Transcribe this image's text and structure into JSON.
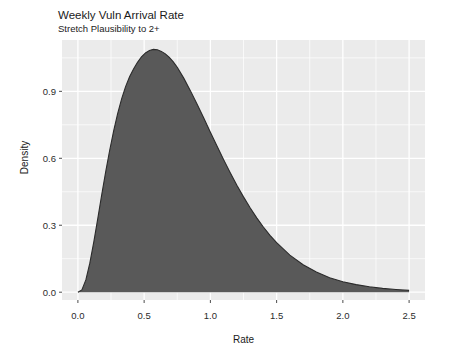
{
  "chart_data": {
    "type": "area",
    "title": "Weekly Vuln Arrival Rate",
    "subtitle": "Stretch Plausibility to 2+",
    "xlabel": "Rate",
    "ylabel": "Density",
    "xlim": [
      -0.12,
      2.62
    ],
    "ylim": [
      -0.035,
      1.13
    ],
    "xticks": [
      0.0,
      0.5,
      1.0,
      1.5,
      2.0,
      2.5
    ],
    "xtick_labels": [
      "0.0",
      "0.5",
      "1.0",
      "1.5",
      "2.0",
      "2.5"
    ],
    "yticks": [
      0.0,
      0.3,
      0.6,
      0.9
    ],
    "ytick_labels": [
      "0.0",
      "0.3",
      "0.6",
      "0.9"
    ],
    "grid": true,
    "grid_color": "#ffffff",
    "panel_background": "#ebebeb",
    "legend": "none",
    "series": [
      {
        "name": "Density",
        "fill": "#595959",
        "line_color": "#2b2b2b",
        "x": [
          0.0,
          0.03,
          0.06,
          0.09,
          0.12,
          0.15,
          0.18,
          0.21,
          0.24,
          0.27,
          0.3,
          0.33,
          0.36,
          0.39,
          0.42,
          0.45,
          0.48,
          0.51,
          0.54,
          0.57,
          0.6,
          0.63,
          0.66,
          0.69,
          0.72,
          0.75,
          0.8,
          0.85,
          0.9,
          0.95,
          1.0,
          1.05,
          1.1,
          1.15,
          1.2,
          1.25,
          1.3,
          1.35,
          1.4,
          1.45,
          1.5,
          1.6,
          1.7,
          1.8,
          1.9,
          2.0,
          2.1,
          2.2,
          2.3,
          2.4,
          2.5
        ],
        "y": [
          0.0,
          0.01,
          0.055,
          0.13,
          0.225,
          0.33,
          0.437,
          0.54,
          0.636,
          0.723,
          0.8,
          0.866,
          0.921,
          0.965,
          1.0,
          1.03,
          1.055,
          1.072,
          1.083,
          1.088,
          1.086,
          1.079,
          1.068,
          1.052,
          1.032,
          1.008,
          0.958,
          0.902,
          0.842,
          0.78,
          0.717,
          0.655,
          0.594,
          0.535,
          0.479,
          0.427,
          0.378,
          0.333,
          0.292,
          0.255,
          0.222,
          0.166,
          0.123,
          0.09,
          0.065,
          0.047,
          0.034,
          0.024,
          0.017,
          0.012,
          0.008
        ]
      }
    ],
    "peak": {
      "x": 0.51,
      "y": 1.09
    }
  }
}
